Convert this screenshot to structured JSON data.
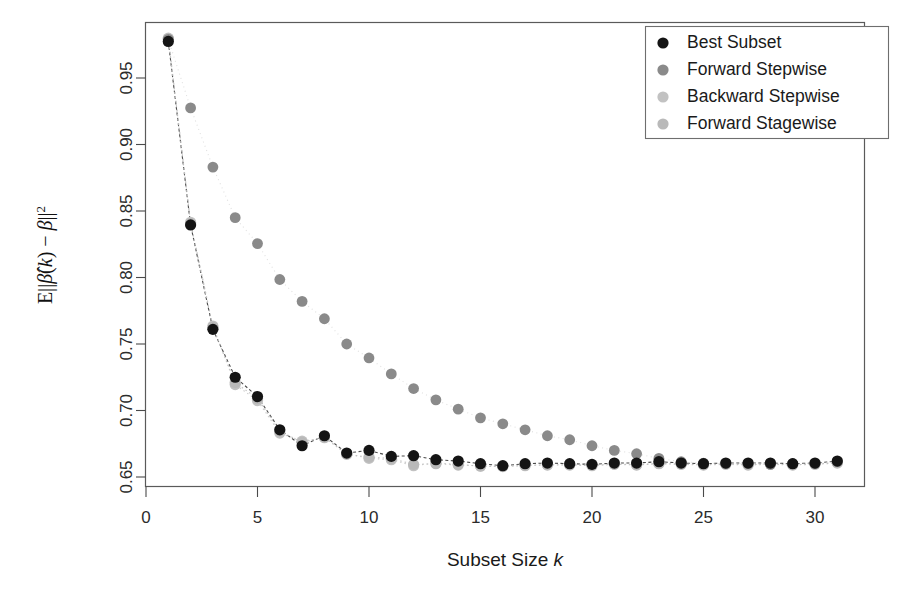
{
  "figure": {
    "width": 908,
    "height": 597,
    "background": "#ffffff"
  },
  "axes": {
    "x_title": "Subset Size k",
    "x_title_plain": "Subset Size",
    "x_title_italic": "k",
    "y_title": "E||β̂(k) − β||²",
    "x_ticks": [
      "0",
      "5",
      "10",
      "15",
      "20",
      "25",
      "30"
    ],
    "x_tick_values": [
      0,
      5,
      10,
      15,
      20,
      25,
      30
    ],
    "y_ticks": [
      "0.65",
      "0.70",
      "0.75",
      "0.80",
      "0.85",
      "0.90",
      "0.95"
    ],
    "y_tick_values": [
      0.65,
      0.7,
      0.75,
      0.8,
      0.85,
      0.9,
      0.95
    ]
  },
  "legend": {
    "position": "top-right",
    "items": [
      {
        "label": "Best Subset",
        "color": "#141414"
      },
      {
        "label": "Forward Stepwise",
        "color": "#8a8a8a"
      },
      {
        "label": "Backward Stepwise",
        "color": "#c2c2c2"
      },
      {
        "label": "Forward Stagewise",
        "color": "#b9b9b9"
      }
    ]
  },
  "chart_data": {
    "type": "scatter",
    "title": "",
    "xlabel": "Subset Size k",
    "ylabel": "E||β̂(k) − β||²",
    "xlim": [
      0,
      31.8
    ],
    "ylim": [
      0.6455,
      0.9875
    ],
    "grid": false,
    "legend_position": "top-right",
    "x": [
      1,
      2,
      3,
      4,
      5,
      6,
      7,
      8,
      9,
      10,
      11,
      12,
      13,
      14,
      15,
      16,
      17,
      18,
      19,
      20,
      21,
      22,
      23,
      24,
      25,
      26,
      27,
      28,
      29,
      30,
      31
    ],
    "series": [
      {
        "name": "Best Subset",
        "color": "#141414",
        "values": [
          0.9775,
          0.8395,
          0.761,
          0.725,
          0.7105,
          0.6855,
          0.6735,
          0.681,
          0.668,
          0.67,
          0.6655,
          0.666,
          0.663,
          0.662,
          0.66,
          0.6585,
          0.66,
          0.6605,
          0.66,
          0.6595,
          0.6605,
          0.6605,
          0.6615,
          0.6605,
          0.66,
          0.6605,
          0.6605,
          0.6605,
          0.66,
          0.6605,
          0.662
        ]
      },
      {
        "name": "Forward Stepwise",
        "color": "#8a8a8a",
        "values": [
          0.979,
          0.9275,
          0.883,
          0.845,
          0.8255,
          0.7985,
          0.782,
          0.769,
          0.75,
          0.7395,
          0.7275,
          0.7165,
          0.708,
          0.701,
          0.6945,
          0.69,
          0.6855,
          0.681,
          0.678,
          0.6735,
          0.67,
          0.6675,
          0.664,
          0.6615,
          0.6605,
          0.66,
          0.66,
          0.6595,
          0.66,
          0.66,
          0.6615
        ]
      },
      {
        "name": "Backward Stepwise",
        "color": "#c2c2c2",
        "values": [
          0.98,
          0.8415,
          0.7635,
          0.7195,
          0.7075,
          0.683,
          0.677,
          0.6795,
          0.6675,
          0.664,
          0.663,
          0.6585,
          0.6605,
          0.6595,
          0.658,
          0.658,
          0.6585,
          0.659,
          0.659,
          0.6585,
          0.6595,
          0.659,
          0.66,
          0.6595,
          0.659,
          0.6595,
          0.659,
          0.6595,
          0.659,
          0.6595,
          0.6605
        ]
      },
      {
        "name": "Forward Stagewise",
        "color": "#b9b9b9",
        "values": [
          0.9795,
          0.8405,
          0.7625,
          0.721,
          0.709,
          0.6845,
          0.676,
          0.68,
          0.667,
          0.665,
          0.664,
          0.6595,
          0.66,
          0.659,
          0.6585,
          0.6578,
          0.6588,
          0.6592,
          0.6592,
          0.6588,
          0.6598,
          0.6592,
          0.6602,
          0.6598,
          0.6592,
          0.6598,
          0.6592,
          0.6598,
          0.6592,
          0.6598,
          0.6608
        ]
      }
    ],
    "connector_lines": {
      "enabled": true,
      "description": "thin dashed/dotted connectors join early points of the overlapping series"
    }
  }
}
